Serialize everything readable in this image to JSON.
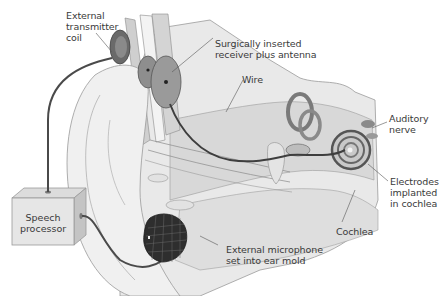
{
  "diagram": {
    "labels": {
      "transmitter": "External\ntransmitter\ncoil",
      "receiver": "Surgically inserted\nreceiver plus antenna",
      "wire": "Wire",
      "auditory_nerve": "Auditory\nnerve",
      "electrodes": "Electrodes\nimplanted\nin cochlea",
      "cochlea": "Cochlea",
      "microphone": "External microphone\nset into ear mold",
      "processor": "Speech\nprocessor"
    },
    "colors": {
      "background": "#ffffff",
      "tissue_light": "#ececec",
      "tissue_mid": "#d6d6d6",
      "tissue_dark": "#b9b9b9",
      "outline": "#8a8a8a",
      "wire": "#4a4a4a",
      "device_dark": "#2e2e2e",
      "label_text": "#3a3a3a",
      "leader_line": "#555555"
    }
  }
}
